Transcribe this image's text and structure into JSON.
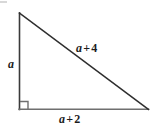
{
  "figure": {
    "kind": "right-triangle",
    "background_color": "#ffffff",
    "stroke_color": "#3a3a3a",
    "text_color": "#1c1c1c"
  },
  "geometry": {
    "vertices": {
      "top": {
        "x": 19,
        "y": 13
      },
      "bottom_left": {
        "x": 19,
        "y": 109
      },
      "bottom_right": {
        "x": 148,
        "y": 109
      }
    },
    "right_angle_marker": {
      "at": "bottom_left",
      "size": 8,
      "x": 20,
      "y": 101
    }
  },
  "labels": {
    "vertical_leg": {
      "text": "a",
      "variable": "a",
      "operator": "",
      "number": "",
      "side": "vertical-leg"
    },
    "hypotenuse": {
      "text": "a + 4",
      "variable": "a",
      "operator": "+",
      "number": "4",
      "side": "hypotenuse"
    },
    "horizontal_leg": {
      "text": "a + 2",
      "variable": "a",
      "operator": "+",
      "number": "2",
      "side": "horizontal-leg"
    }
  }
}
